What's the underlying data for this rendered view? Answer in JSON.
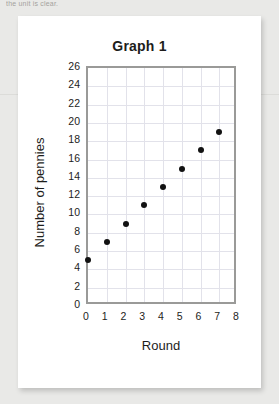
{
  "page": {
    "cutoff_text": "the unit is clear."
  },
  "figure": {
    "title": "Graph 1"
  },
  "chart_data": {
    "type": "scatter",
    "title": "Graph 1",
    "xlabel": "Round",
    "ylabel": "Number of pennies",
    "x": [
      0,
      1,
      2,
      3,
      4,
      5,
      6,
      7
    ],
    "values": [
      5,
      7,
      9,
      11,
      13,
      15,
      17,
      19
    ],
    "series": [
      {
        "name": "Number of pennies",
        "points": [
          {
            "x": 0,
            "y": 5
          },
          {
            "x": 1,
            "y": 7
          },
          {
            "x": 2,
            "y": 9
          },
          {
            "x": 3,
            "y": 11
          },
          {
            "x": 4,
            "y": 13
          },
          {
            "x": 5,
            "y": 15
          },
          {
            "x": 6,
            "y": 17
          },
          {
            "x": 7,
            "y": 19
          }
        ]
      }
    ],
    "xlim": [
      0,
      8
    ],
    "ylim": [
      0,
      26
    ],
    "xticks": [
      0,
      1,
      2,
      3,
      4,
      5,
      6,
      7,
      8
    ],
    "yticks": [
      0,
      2,
      4,
      6,
      8,
      10,
      12,
      14,
      16,
      18,
      20,
      22,
      24,
      26
    ],
    "xtick_labels": [
      "0",
      "1",
      "2",
      "3",
      "4",
      "5",
      "6",
      "7",
      "8"
    ],
    "ytick_labels": [
      "0",
      "2",
      "4",
      "6",
      "8",
      "10",
      "12",
      "14",
      "16",
      "18",
      "20",
      "22",
      "24",
      "26"
    ],
    "grid": true,
    "legend": false,
    "marker_color": "#121212",
    "grid_color": "#e2e2ea",
    "frame_color": "#9a9a98"
  }
}
